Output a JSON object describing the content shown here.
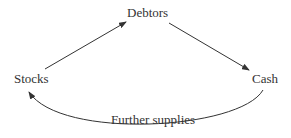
{
  "diagram": {
    "type": "cycle",
    "nodes": [
      {
        "id": "debtors",
        "label": "Debtors"
      },
      {
        "id": "cash",
        "label": "Cash"
      },
      {
        "id": "stocks",
        "label": "Stocks"
      }
    ],
    "edges": [
      {
        "from": "stocks",
        "to": "debtors",
        "label": ""
      },
      {
        "from": "debtors",
        "to": "cash",
        "label": ""
      },
      {
        "from": "cash",
        "to": "stocks",
        "label": "Further supplies"
      }
    ],
    "colors": {
      "line": "#333333",
      "text": "#333333",
      "background": "#ffffff"
    }
  }
}
